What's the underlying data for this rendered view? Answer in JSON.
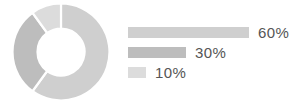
{
  "chart_data": {
    "type": "pie",
    "title": "",
    "subtitle": "",
    "xlabel": "",
    "ylabel": "",
    "legend_position": "right",
    "grid": false,
    "style": "donut",
    "categories": [
      "60%",
      "30%",
      "10%"
    ],
    "values": [
      60,
      30,
      10
    ],
    "series": [
      {
        "name": "share",
        "values": [
          60,
          30,
          10
        ]
      }
    ],
    "data_labels": [
      "60%",
      "30%",
      "10%"
    ],
    "slices": [
      {
        "label": "60%",
        "value": 60,
        "color": "#cfcfcf",
        "start_angle": 0,
        "end_angle": 216
      },
      {
        "label": "30%",
        "value": 30,
        "color": "#bdbdbd",
        "start_angle": 216,
        "end_angle": 324
      },
      {
        "label": "10%",
        "value": 10,
        "color": "#dcdcdc",
        "start_angle": 324,
        "end_angle": 360
      }
    ],
    "legend": [
      {
        "label": "60%",
        "value": 60,
        "bar_color": "#cfcfcf",
        "bar_width_px": 121
      },
      {
        "label": "30%",
        "value": 30,
        "bar_color": "#bdbdbd",
        "bar_width_px": 58
      },
      {
        "label": "10%",
        "value": 10,
        "bar_color": "#dcdcdc",
        "bar_width_px": 18
      }
    ]
  },
  "colors": {
    "background": "#ffffff",
    "slice_60": "#cfcfcf",
    "slice_30": "#bdbdbd",
    "slice_10": "#dcdcdc",
    "separator": "#ffffff",
    "label_text": "#555555"
  }
}
